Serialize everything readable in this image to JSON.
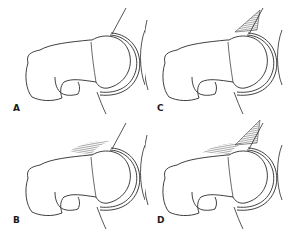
{
  "figure": {
    "panels": [
      {
        "id": "A",
        "label": "A",
        "impingement": "none"
      },
      {
        "id": "B",
        "label": "B",
        "impingement": "cam"
      },
      {
        "id": "C",
        "label": "C",
        "impingement": "pincer"
      },
      {
        "id": "D",
        "label": "D",
        "impingement": "mixed"
      }
    ],
    "colors": {
      "line": "#2a2a2a",
      "background": "#ffffff"
    }
  }
}
